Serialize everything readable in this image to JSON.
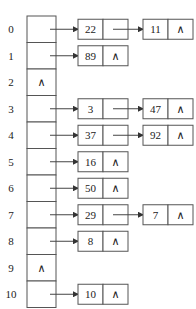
{
  "diagram": {
    "type": "hash-table-chaining",
    "null_symbol": "∧",
    "buckets": [
      {
        "index": "0",
        "chain": [
          "22",
          "11"
        ]
      },
      {
        "index": "1",
        "chain": [
          "89"
        ]
      },
      {
        "index": "2",
        "chain": []
      },
      {
        "index": "3",
        "chain": [
          "3",
          "47"
        ]
      },
      {
        "index": "4",
        "chain": [
          "37",
          "92"
        ]
      },
      {
        "index": "5",
        "chain": [
          "16"
        ]
      },
      {
        "index": "6",
        "chain": [
          "50"
        ]
      },
      {
        "index": "7",
        "chain": [
          "29",
          "7"
        ]
      },
      {
        "index": "8",
        "chain": [
          "8"
        ]
      },
      {
        "index": "9",
        "chain": []
      },
      {
        "index": "10",
        "chain": [
          "10"
        ]
      }
    ]
  }
}
